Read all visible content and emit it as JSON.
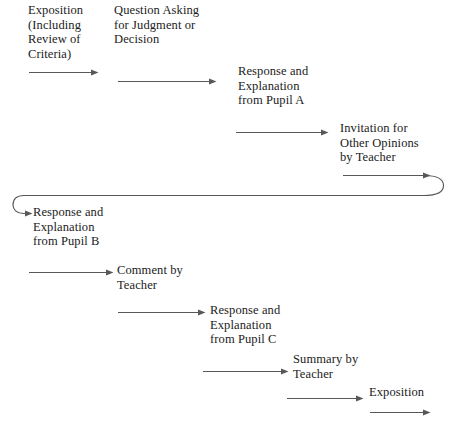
{
  "diagram": {
    "type": "flowchart",
    "background_color": "#ffffff",
    "line_color": "#58585a",
    "text_color": "#1b1b1b",
    "nodes": [
      {
        "id": "n1",
        "label": "Exposition\n(Including\nReview of\nCriteria)"
      },
      {
        "id": "n2",
        "label": "Question Asking\nfor Judgment or\nDecision"
      },
      {
        "id": "n3",
        "label": "Response and\nExplanation\nfrom Pupil A"
      },
      {
        "id": "n4",
        "label": "Invitation for\nOther Opinions\nby Teacher"
      },
      {
        "id": "n5",
        "label": "Response and\nExplanation\nfrom Pupil B"
      },
      {
        "id": "n6",
        "label": "Comment by\nTeacher"
      },
      {
        "id": "n7",
        "label": "Response and\nExplanation\nfrom Pupil C"
      },
      {
        "id": "n8",
        "label": "Summary by\nTeacher"
      },
      {
        "id": "n9",
        "label": "Exposition"
      }
    ],
    "connectors": [
      {
        "id": "a1",
        "from": "n1",
        "to": "n2",
        "style": "straight-arrow"
      },
      {
        "id": "a2",
        "from": "n2",
        "to": "n3",
        "style": "straight-arrow"
      },
      {
        "id": "a3",
        "from": "n3",
        "to": "n4",
        "style": "straight-arrow"
      },
      {
        "id": "a4",
        "from": "n4",
        "to": "n5",
        "style": "wrap-around-arrow"
      },
      {
        "id": "a5",
        "from": "n5",
        "to": "n6",
        "style": "straight-arrow"
      },
      {
        "id": "a6",
        "from": "n6",
        "to": "n7",
        "style": "straight-arrow"
      },
      {
        "id": "a7",
        "from": "n7",
        "to": "n8",
        "style": "straight-arrow"
      },
      {
        "id": "a8",
        "from": "n8",
        "to": "n9",
        "style": "straight-arrow"
      },
      {
        "id": "a9",
        "from": "n9",
        "to": "",
        "style": "straight-arrow"
      }
    ]
  }
}
